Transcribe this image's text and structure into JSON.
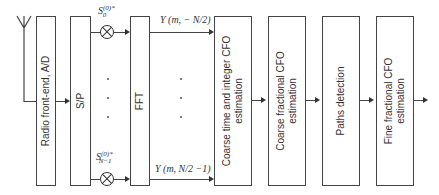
{
  "blocks": [
    {
      "id": "radio",
      "label": "Radio front-end, A/D"
    },
    {
      "id": "sp",
      "label": "S/P"
    },
    {
      "id": "fft",
      "label": "FFT"
    },
    {
      "id": "coarse_time",
      "label": "Coarse time and integer CFO estimation"
    },
    {
      "id": "coarse_frac",
      "label": "Coarse fractional CFO estimation"
    },
    {
      "id": "paths",
      "label": "Paths detection"
    },
    {
      "id": "fine_frac",
      "label": "Fine fractional CFO estimation"
    }
  ],
  "labels": {
    "s0": "S",
    "s0_sup": "(0)*",
    "s0_sub": "0",
    "sn": "S",
    "sn_sup": "(0)*",
    "sn_sub": "N−1",
    "y_top": "Y (m, − N/2)",
    "y_bottom": "Y (m, N/2 −1)"
  }
}
